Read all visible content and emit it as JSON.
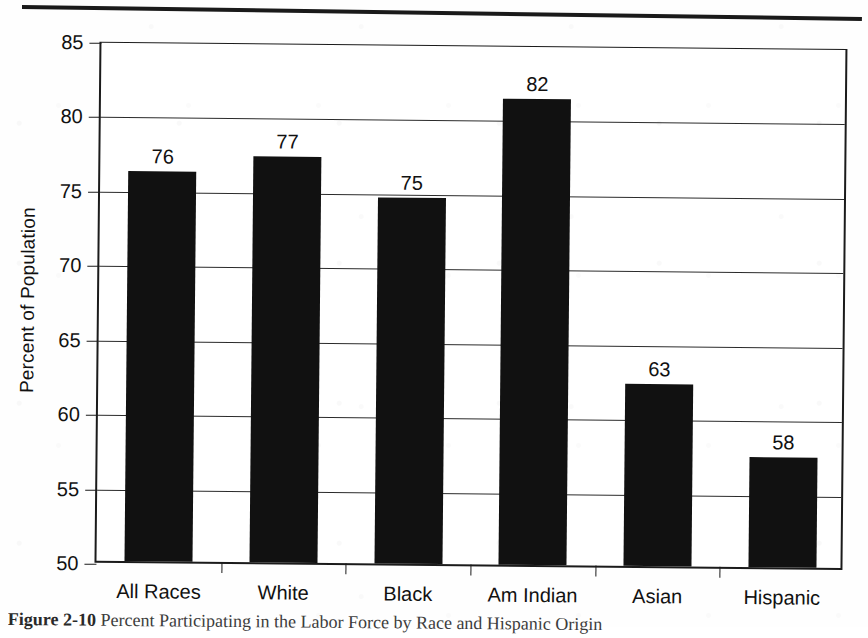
{
  "figure": {
    "caption_label": "Figure 2-10",
    "caption_text": "Percent Participating in the Labor Force by Race and Hispanic Origin",
    "top_rule": "page-rule"
  },
  "chart_data": {
    "type": "bar",
    "title": "",
    "xlabel": "",
    "ylabel": "Percent of Population",
    "categories": [
      "All Races",
      "White",
      "Black",
      "Am Indian",
      "Asian",
      "Hispanic"
    ],
    "values": [
      76,
      77,
      75,
      82,
      63,
      58
    ],
    "value_labels": [
      "76",
      "77",
      "75",
      "82",
      "63",
      "58"
    ],
    "ylim": [
      50,
      85
    ],
    "yticks": [
      50,
      55,
      60,
      65,
      70,
      75,
      80,
      85
    ],
    "ytick_labels": [
      "50",
      "55",
      "60",
      "65",
      "70",
      "75",
      "80",
      "85"
    ],
    "grid": "horizontal",
    "legend": "none",
    "bar_color": "#111111",
    "axis_color": "#1b1b1b",
    "background_color": "#ffffff",
    "bar_precise_heights": [
      76.2,
      77.3,
      74.6,
      81.3,
      62.2,
      57.4
    ]
  }
}
